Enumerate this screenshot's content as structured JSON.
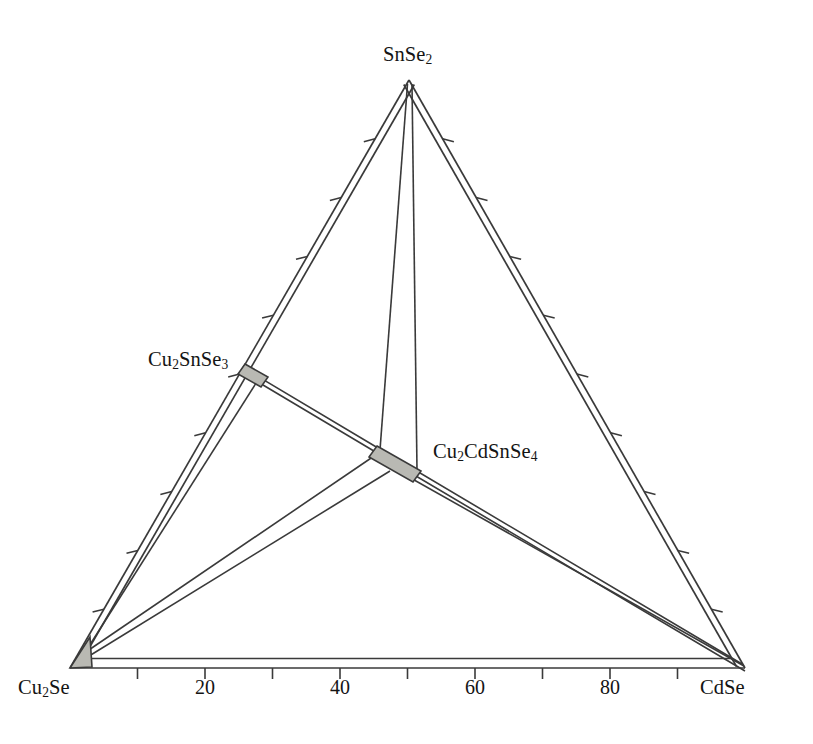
{
  "figure": {
    "kind": "ternary-phase-diagram",
    "background_color": "#ffffff",
    "line_color": "#3a3a3a",
    "fill_color": "#b9b9b3",
    "text_color": "#141414"
  },
  "vertices": {
    "apex": {
      "label_html": "SnSe<sub>2</sub>",
      "text": "SnSe2",
      "component": "SnSe2",
      "x": 409,
      "y": 80
    },
    "bottom_left": {
      "label_html": "Cu<sub>2</sub>Se",
      "text": "Cu2Se",
      "component": "Cu2Se",
      "x": 70,
      "y": 668
    },
    "bottom_right": {
      "label_html": "CdSe",
      "text": "CdSe",
      "component": "CdSe",
      "x": 745,
      "y": 668
    }
  },
  "phases": [
    {
      "id": "cu2snse3",
      "label_html": "Cu<sub>2</sub>SnSe<sub>3</sub>",
      "text": "Cu2SnSe3",
      "edge": "left",
      "position_fraction": 0.5,
      "description": "solid-solution region on the Cu2Se-SnSe2 join"
    },
    {
      "id": "cu2cdsnse4",
      "label_html": "Cu<sub>2</sub>CdSnSe<sub>4</sub>",
      "text": "Cu2CdSnSe4",
      "edge": "interior",
      "description": "quaternary compound solid-solution region inside the triangle"
    },
    {
      "id": "cu2se-corner",
      "label_html": "Cu<sub>2</sub>Se",
      "text": "Cu2Se",
      "edge": "corner",
      "description": "small solid-solution wedge at the Cu2Se corner"
    }
  ],
  "axis": {
    "bottom": {
      "from": "Cu2Se",
      "to": "CdSe",
      "major_ticks": [
        20,
        40,
        60,
        80
      ],
      "major_tick_labels": [
        "20",
        "40",
        "60",
        "80"
      ],
      "minor_tick_step": 10,
      "tick_direction": "outward",
      "range": [
        0,
        100
      ]
    },
    "left": {
      "from": "Cu2Se",
      "to": "SnSe2",
      "major_ticks": [
        10,
        20,
        30,
        40,
        50,
        60,
        70,
        80,
        90
      ],
      "tick_direction": "outward",
      "range": [
        0,
        100
      ]
    },
    "right": {
      "from": "SnSe2",
      "to": "CdSe",
      "major_ticks": [
        10,
        20,
        30,
        40,
        50,
        60,
        70,
        80,
        90
      ],
      "tick_direction": "outward",
      "range": [
        0,
        100
      ]
    }
  },
  "chart_data": {
    "type": "scatter",
    "title": "",
    "subtitle": "",
    "xlabel": "",
    "ylabel": "",
    "diagram_type": "ternary phase diagram (isothermal section)",
    "components": [
      "Cu2Se",
      "SnSe2",
      "CdSe"
    ],
    "tick_labels_bottom": [
      "20",
      "40",
      "60",
      "80"
    ],
    "tick_values_bottom": [
      20,
      40,
      60,
      80
    ],
    "tick_step_minor": 10,
    "axis_ranges": {
      "Cu2Se": [
        0,
        100
      ],
      "SnSe2": [
        0,
        100
      ],
      "CdSe": [
        0,
        100
      ]
    },
    "grid": false,
    "legend": "none",
    "points": [
      {
        "name": "SnSe2",
        "label": "SnSe2",
        "Cu2Se": 0,
        "SnSe2": 100,
        "CdSe": 0
      },
      {
        "name": "Cu2Se",
        "label": "Cu2Se",
        "Cu2Se": 100,
        "SnSe2": 0,
        "CdSe": 0
      },
      {
        "name": "CdSe",
        "label": "CdSe",
        "Cu2Se": 0,
        "SnSe2": 0,
        "CdSe": 100
      },
      {
        "name": "Cu2SnSe3",
        "label": "Cu2SnSe3",
        "Cu2Se": 50,
        "SnSe2": 50,
        "CdSe": 0
      },
      {
        "name": "Cu2CdSnSe4",
        "label": "Cu2CdSnSe4",
        "Cu2Se": 25,
        "SnSe2": 25,
        "CdSe": 50
      }
    ],
    "tie_lines": [
      {
        "from": "Cu2SnSe3",
        "to": "CdSe"
      },
      {
        "from": "Cu2CdSnSe4",
        "to": "SnSe2"
      },
      {
        "from": "Cu2CdSnSe4",
        "to": "Cu2Se"
      },
      {
        "from": "Cu2CdSnSe4",
        "to": "CdSe"
      },
      {
        "from": "Cu2Se",
        "to": "CdSe"
      }
    ],
    "series": [
      {
        "name": "invariant phases",
        "values": [
          {
            "x": 0,
            "y": 100,
            "label": "SnSe2"
          },
          {
            "x": 0,
            "y": 0,
            "label": "Cu2Se"
          },
          {
            "x": 100,
            "y": 0,
            "label": "CdSe"
          },
          {
            "x": 0,
            "y": 50,
            "label": "Cu2SnSe3"
          },
          {
            "x": 50,
            "y": 25,
            "label": "Cu2CdSnSe4"
          }
        ]
      }
    ]
  }
}
